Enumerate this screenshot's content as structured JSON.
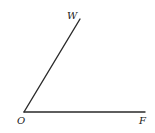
{
  "diagram": {
    "type": "angle",
    "points": {
      "O": {
        "label": "O",
        "x": 24,
        "y": 112
      },
      "W": {
        "label": "W",
        "x": 80,
        "y": 19
      },
      "F": {
        "label": "F",
        "x": 145,
        "y": 112
      }
    },
    "rays": [
      {
        "from": "O",
        "to": "W"
      },
      {
        "from": "O",
        "to": "F"
      }
    ],
    "labels": {
      "W": "W",
      "O": "O",
      "F": "F"
    },
    "line_color": "#2a2a2a"
  }
}
